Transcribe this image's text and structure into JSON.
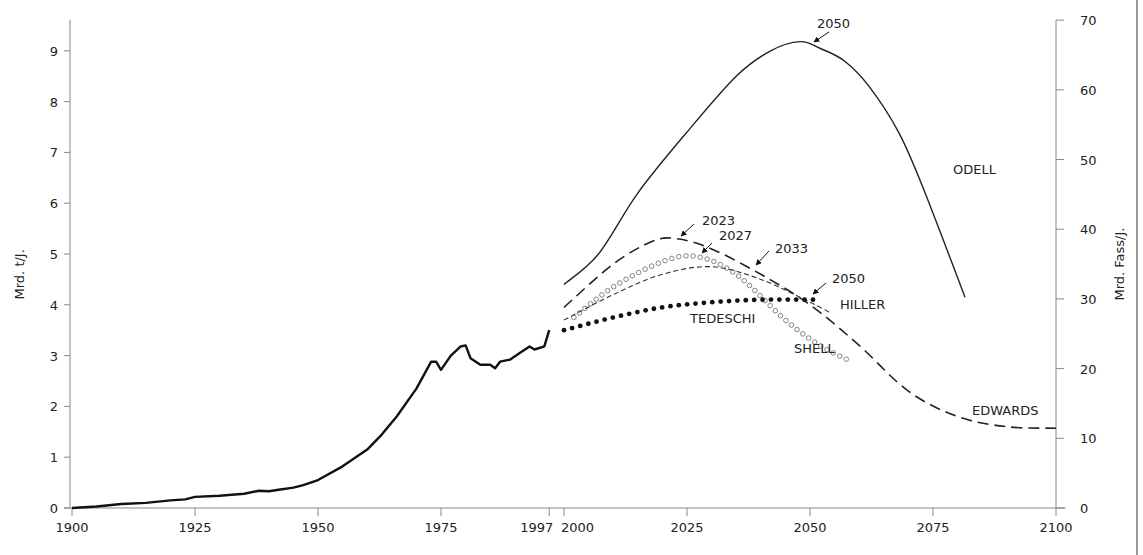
{
  "chart_data": {
    "type": "line",
    "title": "",
    "xlabel": "",
    "ylabel_left": "Mrd. t/J.",
    "ylabel_right": "Mrd. Fass/J.",
    "xlim": [
      1900,
      2100
    ],
    "ylim_left": [
      0,
      9.5
    ],
    "ylim_right": [
      0,
      70
    ],
    "x_ticks": [
      1900,
      1925,
      1950,
      1975,
      1997,
      2000,
      2025,
      2050,
      2075,
      2100
    ],
    "y_ticks_left": [
      0,
      1,
      2,
      3,
      4,
      5,
      6,
      7,
      8,
      9
    ],
    "y_ticks_right": [
      0,
      10,
      20,
      30,
      40,
      50,
      60,
      70
    ],
    "grid": false,
    "legend": "inline labels",
    "series": [
      {
        "name": "Historical production",
        "style": "solid-thick",
        "x": [
          1900,
          1905,
          1910,
          1915,
          1920,
          1923,
          1925,
          1930,
          1935,
          1938,
          1940,
          1942,
          1945,
          1947,
          1950,
          1955,
          1960,
          1963,
          1966,
          1970,
          1973,
          1974,
          1975,
          1977,
          1979,
          1980,
          1981,
          1983,
          1985,
          1986,
          1987,
          1989,
          1991,
          1993,
          1994,
          1996,
          1997
        ],
        "values": [
          0,
          0.03,
          0.08,
          0.1,
          0.15,
          0.17,
          0.22,
          0.24,
          0.28,
          0.34,
          0.33,
          0.36,
          0.4,
          0.45,
          0.55,
          0.82,
          1.15,
          1.45,
          1.8,
          2.35,
          2.88,
          2.88,
          2.72,
          3.0,
          3.18,
          3.2,
          2.95,
          2.82,
          2.82,
          2.75,
          2.88,
          2.92,
          3.05,
          3.18,
          3.12,
          3.18,
          3.5
        ]
      },
      {
        "name": "ODELL",
        "style": "solid-thin",
        "x": [
          2000,
          2007,
          2015,
          2025,
          2035,
          2042,
          2048,
          2052,
          2057,
          2062,
          2068,
          2073,
          2081.5
        ],
        "values": [
          4.4,
          5.0,
          6.2,
          7.4,
          8.5,
          9.0,
          9.18,
          9.05,
          8.8,
          8.3,
          7.4,
          6.3,
          4.15
        ]
      },
      {
        "name": "EDWARDS",
        "style": "long-dash",
        "x": [
          2000,
          2010,
          2018,
          2023,
          2030,
          2040,
          2050,
          2060,
          2070,
          2080,
          2090,
          2100
        ],
        "values": [
          3.95,
          4.8,
          5.25,
          5.3,
          5.1,
          4.6,
          4.0,
          3.2,
          2.3,
          1.8,
          1.6,
          1.57
        ]
      },
      {
        "name": "SHELL",
        "style": "open-circles",
        "x": [
          2002,
          2010,
          2020,
          2027,
          2035,
          2045,
          2052,
          2058
        ],
        "values": [
          3.75,
          4.35,
          4.85,
          4.95,
          4.6,
          3.7,
          3.2,
          2.9
        ]
      },
      {
        "name": "HILLER",
        "style": "short-dash",
        "x": [
          2000,
          2010,
          2020,
          2030,
          2040,
          2050,
          2054
        ],
        "values": [
          3.7,
          4.2,
          4.6,
          4.75,
          4.5,
          4.05,
          3.85
        ]
      },
      {
        "name": "TEDESCHI",
        "style": "filled-dots",
        "x": [
          2000,
          2010,
          2020,
          2030,
          2040,
          2050,
          2052
        ],
        "values": [
          3.5,
          3.75,
          3.95,
          4.05,
          4.1,
          4.1,
          4.1
        ]
      }
    ],
    "annotations": [
      {
        "text": "2050",
        "target_series": "ODELL",
        "peak_year": 2050
      },
      {
        "text": "2023",
        "target_series": "EDWARDS",
        "peak_year": 2023
      },
      {
        "text": "2027",
        "target_series": "SHELL",
        "peak_year": 2027
      },
      {
        "text": "2033",
        "target_series": "HILLER",
        "peak_year": 2033
      },
      {
        "text": "2050",
        "target_series": "TEDESCHI",
        "peak_year": 2050
      }
    ]
  }
}
